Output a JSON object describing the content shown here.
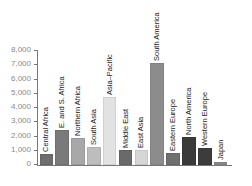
{
  "chart_data": {
    "type": "bar",
    "title": "",
    "xlabel": "",
    "ylabel": "",
    "ylim": [
      0,
      8000
    ],
    "yticks": [
      0,
      1000,
      2000,
      3000,
      4000,
      5000,
      6000,
      7000,
      8000
    ],
    "ytick_labels": [
      "0",
      "1,000",
      "2,000",
      "3,000",
      "4,000",
      "5,000",
      "6,000",
      "7,000",
      "8,000"
    ],
    "grid": false,
    "legend": null,
    "bar_label_orientation": "vertical, inside plot above each bar",
    "categories": [
      "Central Africa",
      "E. and S. Africa",
      "Northern Africa",
      "South Asia",
      "Asia–Pacific",
      "Middle East",
      "East Asia",
      "South America",
      "Eastern Europe",
      "North America",
      "Western Europe",
      "Japan"
    ],
    "values": [
      700,
      2400,
      1800,
      1200,
      4700,
      1000,
      1000,
      7100,
      800,
      1900,
      1100,
      150
    ],
    "colors": [
      "#6e6e6e",
      "#7a7a7a",
      "#a8a8a8",
      "#bdbdbd",
      "#e2e2e2",
      "#6a6a6a",
      "#d6d6d6",
      "#8c8c8c",
      "#6f6f6f",
      "#3a3a3a",
      "#3c3c3c",
      "#8a8a8a"
    ]
  }
}
